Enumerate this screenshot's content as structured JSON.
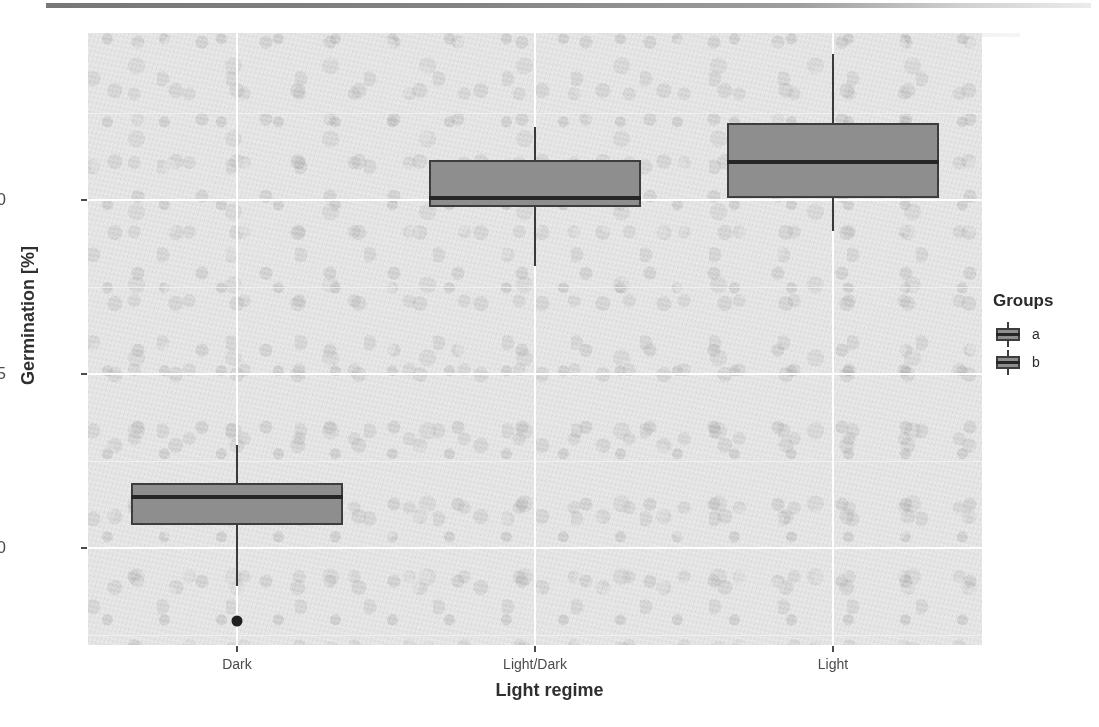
{
  "chart_data": {
    "type": "boxplot",
    "title": "",
    "xlabel": "Light regime",
    "ylabel": "Germination [%]",
    "categories": [
      "Dark",
      "Light/Dark",
      "Light"
    ],
    "ylim": [
      67.2,
      84.8
    ],
    "y_ticks": [
      70,
      75,
      80
    ],
    "y_tick_labels": [
      "70",
      "75",
      "80"
    ],
    "grid": true,
    "legend": {
      "title": "Groups",
      "position": "right",
      "entries": [
        {
          "label": "a",
          "fill": "#8e8e8e",
          "stroke": "#3d3d3d"
        },
        {
          "label": "b",
          "fill": "#8e8e8e",
          "stroke": "#3d3d3d"
        }
      ]
    },
    "boxes": [
      {
        "category": "Dark",
        "group": "a",
        "lower_whisker": 68.9,
        "q1": 70.65,
        "median": 71.45,
        "q3": 71.85,
        "upper_whisker": 72.95,
        "outliers": [
          67.9
        ]
      },
      {
        "category": "Light/Dark",
        "group": "b",
        "lower_whisker": 78.1,
        "q1": 79.8,
        "median": 80.05,
        "q3": 81.15,
        "upper_whisker": 82.1,
        "outliers": []
      },
      {
        "category": "Light",
        "group": "b",
        "lower_whisker": 79.1,
        "q1": 80.05,
        "median": 81.1,
        "q3": 82.2,
        "upper_whisker": 84.2,
        "outliers": []
      }
    ],
    "colors": {
      "panel_background": "#e3e3e3",
      "gridline_major": "#fdfdfd",
      "gridline_minor": "#f2f2f2",
      "box_fill": "#8e8e8e",
      "box_stroke": "#3d3d3d",
      "median": "#262626",
      "whisker": "#3a3a3a",
      "outlier": "#1f1f1f",
      "axis_text": "#4b4b4b",
      "title_text": "#2f2f2f"
    }
  }
}
